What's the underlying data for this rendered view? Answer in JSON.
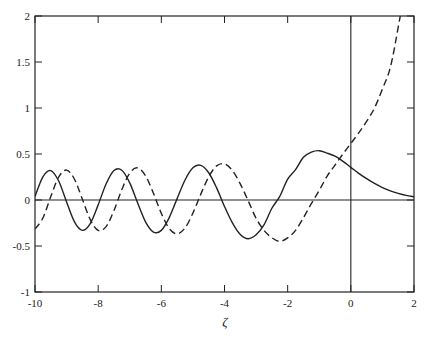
{
  "chart_data": {
    "type": "line",
    "title": "",
    "xlabel": "ζ",
    "ylabel": "",
    "xlim": [
      -10,
      2
    ],
    "ylim": [
      -1,
      2
    ],
    "x_ticks": [
      "-10",
      "-8",
      "-6",
      "-4",
      "-2",
      "0",
      "2"
    ],
    "y_ticks": [
      "-1",
      "-0.5",
      "0",
      "0.5",
      "1",
      "1.5",
      "2"
    ],
    "grid": false,
    "legend": null,
    "reference_lines": [
      {
        "orientation": "horizontal",
        "value": 0
      },
      {
        "orientation": "vertical",
        "value": 0
      }
    ],
    "x": [
      -10,
      -9.75,
      -9.5,
      -9.25,
      -9,
      -8.75,
      -8.5,
      -8.25,
      -8,
      -7.75,
      -7.5,
      -7.25,
      -7,
      -6.75,
      -6.5,
      -6.25,
      -6,
      -5.75,
      -5.5,
      -5.25,
      -5,
      -4.75,
      -4.5,
      -4.25,
      -4,
      -3.75,
      -3.5,
      -3.25,
      -3,
      -2.75,
      -2.5,
      -2.25,
      -2,
      -1.75,
      -1.5,
      -1.25,
      -1,
      -0.75,
      -0.5,
      -0.25,
      0,
      0.25,
      0.5,
      0.75,
      1,
      1.25,
      1.5,
      1.75,
      2
    ],
    "series": [
      {
        "name": "solid",
        "style": "solid",
        "values": [
          0.039,
          0.252,
          0.319,
          0.206,
          -0.021,
          -0.238,
          -0.33,
          -0.256,
          -0.053,
          0.174,
          0.321,
          0.324,
          0.186,
          -0.032,
          -0.237,
          -0.349,
          -0.33,
          -0.191,
          0.015,
          0.217,
          0.35,
          0.377,
          0.296,
          0.132,
          -0.07,
          -0.249,
          -0.375,
          -0.421,
          -0.378,
          -0.27,
          -0.09,
          0.04,
          0.227,
          0.33,
          0.464,
          0.52,
          0.536,
          0.51,
          0.476,
          0.42,
          0.355,
          0.29,
          0.232,
          0.18,
          0.135,
          0.1,
          0.072,
          0.05,
          0.035
        ]
      },
      {
        "name": "dashed",
        "style": "dashed",
        "values": [
          -0.315,
          -0.196,
          0.037,
          0.25,
          0.325,
          0.226,
          0.009,
          -0.213,
          -0.331,
          -0.29,
          -0.114,
          0.114,
          0.293,
          0.349,
          0.263,
          0.073,
          -0.145,
          -0.311,
          -0.368,
          -0.304,
          -0.142,
          0.064,
          0.251,
          0.371,
          0.392,
          0.321,
          0.175,
          -0.009,
          -0.198,
          -0.33,
          -0.41,
          -0.45,
          -0.412,
          -0.33,
          -0.192,
          -0.04,
          0.104,
          0.26,
          0.38,
          0.5,
          0.614,
          0.73,
          0.854,
          1.0,
          1.207,
          1.44,
          1.879,
          2.4,
          3.298
        ]
      }
    ]
  }
}
